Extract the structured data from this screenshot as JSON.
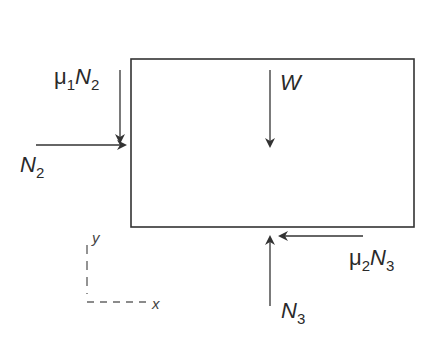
{
  "diagram": {
    "type": "free-body-diagram",
    "body": {
      "shape": "rectangle",
      "x": 131,
      "y": 59,
      "width": 283,
      "height": 168,
      "stroke": "#333333"
    },
    "forces": [
      {
        "id": "mu1N2",
        "mu": "μ",
        "mu_sub": "1",
        "sym": "N",
        "sym_sub": "2",
        "direction": "down",
        "from": [
          120,
          70
        ],
        "to": [
          120,
          142
        ]
      },
      {
        "id": "N2",
        "sym": "N",
        "sym_sub": "2",
        "direction": "right",
        "from": [
          36,
          145
        ],
        "to": [
          125,
          145
        ]
      },
      {
        "id": "W",
        "sym": "W",
        "direction": "down",
        "from": [
          270,
          70
        ],
        "to": [
          270,
          146
        ]
      },
      {
        "id": "mu2N3",
        "mu": "μ",
        "mu_sub": "2",
        "sym": "N",
        "sym_sub": "3",
        "direction": "left",
        "from": [
          363,
          236
        ],
        "to": [
          280,
          236
        ]
      },
      {
        "id": "N3",
        "sym": "N",
        "sym_sub": "3",
        "direction": "up",
        "from": [
          270,
          306
        ],
        "to": [
          270,
          237
        ]
      }
    ],
    "axes": {
      "x_label": "x",
      "y_label": "y",
      "origin": [
        87,
        302
      ],
      "style": "dashed"
    },
    "colors": {
      "line": "#333333",
      "text": "#2a2a2a",
      "axis": "#666666"
    }
  }
}
